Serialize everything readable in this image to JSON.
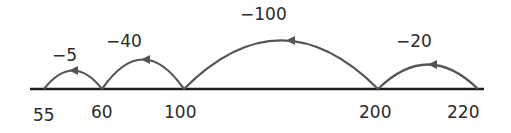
{
  "diagram": {
    "type": "empty-number-line",
    "points": [
      {
        "value": "55",
        "x": 44
      },
      {
        "value": "60",
        "x": 102
      },
      {
        "value": "100",
        "x": 184
      },
      {
        "value": "200",
        "x": 378
      },
      {
        "value": "220",
        "x": 478
      }
    ],
    "jumps": [
      {
        "label": "−5",
        "from": "60",
        "to": "55"
      },
      {
        "label": "−40",
        "from": "100",
        "to": "60"
      },
      {
        "label": "−100",
        "from": "200",
        "to": "100"
      },
      {
        "label": "−20",
        "from": "220",
        "to": "200"
      }
    ],
    "colors": {
      "line": "#1e1e1e",
      "arc": "#555555",
      "text": "#2b2b2b"
    }
  }
}
